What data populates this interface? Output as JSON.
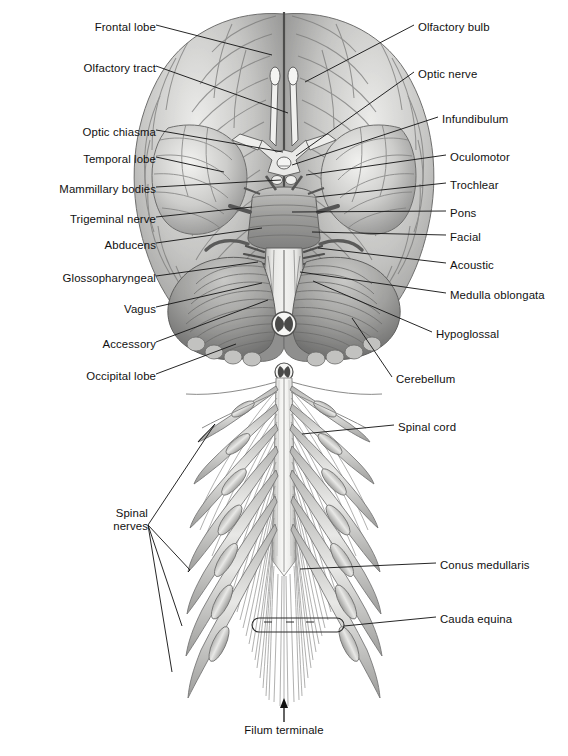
{
  "figure": {
    "view": "inferior (ventral) view",
    "background_color": "#ffffff",
    "ink_color": "#111111",
    "leader_line_color": "#1a1a1a",
    "tissue_tones": {
      "cortex_light": "#e4e4e2",
      "cortex_mid": "#b9b9b7",
      "cortex_dark": "#8d8d8c",
      "sulcus_shadow": "#6e6e6e",
      "cerebellum_mid": "#a9a9a7",
      "cerebellum_dark": "#7c7c7b",
      "brainstem_light": "#dcdcda",
      "nerve_light": "#ededeb",
      "nerve_dark": "#9a9a99"
    }
  },
  "labels_left": [
    {
      "id": "frontal-lobe",
      "text": "Frontal lobe",
      "x": 150,
      "y": 28,
      "tip_x": 272,
      "tip_y": 55
    },
    {
      "id": "olfactory-tract",
      "text": "Olfactory tract",
      "x": 150,
      "y": 69,
      "tip_x": 288,
      "tip_y": 113
    },
    {
      "id": "optic-chiasma",
      "text": "Optic chiasma",
      "x": 150,
      "y": 133,
      "tip_x": 283,
      "tip_y": 152
    },
    {
      "id": "temporal-lobe",
      "text": "Temporal lobe",
      "x": 150,
      "y": 160,
      "tip_x": 224,
      "tip_y": 172
    },
    {
      "id": "mammillary-bodies",
      "text": "Mammillary bodies",
      "x": 150,
      "y": 190,
      "tip_x": 281,
      "tip_y": 180
    },
    {
      "id": "trigeminal-nerve",
      "text": "Trigeminal nerve",
      "x": 150,
      "y": 220,
      "tip_x": 252,
      "tip_y": 207
    },
    {
      "id": "abducens",
      "text": "Abducens",
      "x": 150,
      "y": 246,
      "tip_x": 262,
      "tip_y": 228
    },
    {
      "id": "glossopharyngeal",
      "text": "Glossopharyngeal",
      "x": 150,
      "y": 279,
      "tip_x": 258,
      "tip_y": 262
    },
    {
      "id": "vagus",
      "text": "Vagus",
      "x": 150,
      "y": 310,
      "tip_x": 262,
      "tip_y": 283
    },
    {
      "id": "accessory",
      "text": "Accessory",
      "x": 150,
      "y": 345,
      "tip_x": 268,
      "tip_y": 300
    },
    {
      "id": "occipital-lobe",
      "text": "Occipital lobe",
      "x": 150,
      "y": 377,
      "tip_x": 236,
      "tip_y": 344
    }
  ],
  "labels_right": [
    {
      "id": "olfactory-bulb",
      "text": "Olfactory bulb",
      "x": 418,
      "y": 28,
      "tip_x": 305,
      "tip_y": 82
    },
    {
      "id": "optic-nerve",
      "text": "Optic nerve",
      "x": 418,
      "y": 75,
      "tip_x": 296,
      "tip_y": 156
    },
    {
      "id": "infundibulum",
      "text": "Infundibulum",
      "x": 442,
      "y": 120,
      "tip_x": 292,
      "tip_y": 165
    },
    {
      "id": "oculomotor",
      "text": "Oculomotor",
      "x": 450,
      "y": 158,
      "tip_x": 306,
      "tip_y": 175
    },
    {
      "id": "trochlear",
      "text": "Trochlear",
      "x": 450,
      "y": 186,
      "tip_x": 316,
      "tip_y": 197
    },
    {
      "id": "pons",
      "text": "Pons",
      "x": 450,
      "y": 214,
      "tip_x": 292,
      "tip_y": 212
    },
    {
      "id": "facial",
      "text": "Facial",
      "x": 450,
      "y": 238,
      "tip_x": 312,
      "tip_y": 232
    },
    {
      "id": "acoustic",
      "text": "Acoustic",
      "x": 450,
      "y": 266,
      "tip_x": 318,
      "tip_y": 248
    },
    {
      "id": "medulla-oblongata",
      "text": "Medulla oblongata",
      "x": 450,
      "y": 296,
      "tip_x": 300,
      "tip_y": 272
    },
    {
      "id": "hypoglossal",
      "text": "Hypoglossal",
      "x": 436,
      "y": 335,
      "tip_x": 313,
      "tip_y": 281
    },
    {
      "id": "cerebellum",
      "text": "Cerebellum",
      "x": 396,
      "y": 380,
      "tip_x": 352,
      "tip_y": 318
    }
  ],
  "labels_lower": [
    {
      "id": "spinal-cord",
      "text": "Spinal cord",
      "x": 398,
      "y": 428,
      "tip_x": 302,
      "tip_y": 434
    },
    {
      "id": "conus-medullaris",
      "text": "Conus medullaris",
      "x": 440,
      "y": 566,
      "tip_x": 300,
      "tip_y": 569
    },
    {
      "id": "cauda-equina",
      "text": "Cauda equina",
      "x": 440,
      "y": 620,
      "tip_x": 344,
      "tip_y": 626
    }
  ],
  "labels_multi": {
    "spinal_nerves": {
      "id": "spinal-nerves",
      "line1": "Spinal",
      "line2": "nerves",
      "x": 106,
      "y": 514,
      "anchor_x": 148,
      "anchor_y": 525,
      "tips": [
        {
          "x": 215,
          "y": 424
        },
        {
          "x": 190,
          "y": 570
        },
        {
          "x": 182,
          "y": 626
        },
        {
          "x": 172,
          "y": 672
        }
      ]
    }
  },
  "labels_bottom": {
    "filum_terminale": {
      "id": "filum-terminale",
      "text": "Filum terminale",
      "x": 284,
      "y": 730,
      "arrow_x": 284,
      "arrow_top_y": 700,
      "arrow_bottom_y": 722
    }
  },
  "callout_bracket": {
    "id": "cauda-equina-bracket",
    "x": 252,
    "y": 618,
    "width": 92,
    "height": 14,
    "radius": 7
  }
}
